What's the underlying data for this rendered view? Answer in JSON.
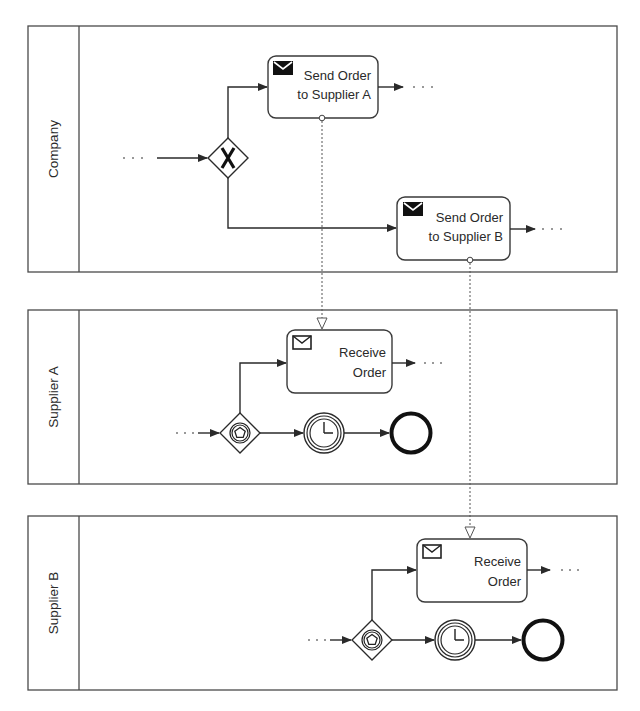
{
  "diagram": {
    "type": "BPMN collaboration",
    "pools": [
      {
        "id": "company",
        "label": "Company"
      },
      {
        "id": "supplier_a",
        "label": "Supplier A"
      },
      {
        "id": "supplier_b",
        "label": "Supplier B"
      }
    ],
    "company": {
      "gateway": {
        "type": "exclusive",
        "symbol": "X"
      },
      "tasks": [
        {
          "id": "send_a",
          "line1": "Send Order",
          "line2": "to Supplier A",
          "icon": "send-message-icon"
        },
        {
          "id": "send_b",
          "line1": "Send Order",
          "line2": "to Supplier B",
          "icon": "send-message-icon"
        }
      ],
      "continuation": "· · ·"
    },
    "supplier_a": {
      "task": {
        "line1": "Receive",
        "line2": "Order",
        "icon": "receive-message-icon"
      },
      "gateway": {
        "type": "event-based"
      },
      "timer": {
        "type": "intermediate timer event"
      },
      "end": {
        "type": "end event"
      },
      "continuation": "· · ·"
    },
    "supplier_b": {
      "task": {
        "line1": "Receive",
        "line2": "Order",
        "icon": "receive-message-icon"
      },
      "gateway": {
        "type": "event-based"
      },
      "timer": {
        "type": "intermediate timer event"
      },
      "end": {
        "type": "end event"
      },
      "continuation": "· · ·"
    },
    "message_flows": [
      {
        "from": "Send Order to Supplier A",
        "to": "Supplier A / Receive Order"
      },
      {
        "from": "Send Order to Supplier B",
        "to": "Supplier B / Receive Order"
      }
    ]
  }
}
